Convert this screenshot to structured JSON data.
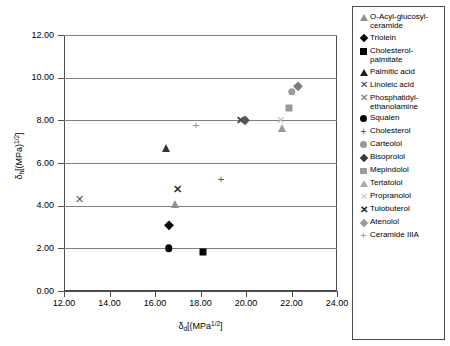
{
  "chart_data": {
    "type": "scatter",
    "title": "",
    "xlabel": "δd[(MPa)1/2]",
    "ylabel": "δh[(MPa)1/2]",
    "xlabel_parts": {
      "symbol": "δ",
      "sub": "d",
      "rest": "[(MPa",
      "sup": "1/2",
      "tail": "]"
    },
    "ylabel_parts": {
      "symbol": "δ",
      "sub": "h",
      "rest": "[(MPa)",
      "sup": "1/2",
      "tail": "]"
    },
    "xlim": [
      12.0,
      24.0
    ],
    "ylim": [
      0.0,
      12.0
    ],
    "xticks": [
      "12.00",
      "14.00",
      "16.00",
      "18.00",
      "20.00",
      "22.00",
      "24.00"
    ],
    "yticks": [
      "0.00",
      "2.00",
      "4.00",
      "6.00",
      "8.00",
      "10.00",
      "12.00"
    ],
    "xtick_values": [
      12,
      14,
      16,
      18,
      20,
      22,
      24
    ],
    "ytick_values": [
      0,
      2,
      4,
      6,
      8,
      10,
      12
    ],
    "grid": "horizontal",
    "legend_position": "right-outside",
    "points": [
      {
        "label": "O-Acyl-glucosyl-ceramide",
        "marker": "triangle",
        "color": "#909090",
        "x": 16.9,
        "y": 4.1
      },
      {
        "label": "Triolein",
        "marker": "diamond",
        "color": "#000000",
        "x": 16.6,
        "y": 3.1
      },
      {
        "label": "Cholesterol-palmitate",
        "marker": "square",
        "color": "#000000",
        "x": 18.1,
        "y": 1.85
      },
      {
        "label": "Palmitic acid",
        "marker": "triangle",
        "color": "#333333",
        "x": 16.5,
        "y": 6.7
      },
      {
        "label": "Linoleic acid",
        "marker": "x",
        "color": "#555555",
        "x": 12.7,
        "y": 4.3
      },
      {
        "label": "Phosphatidyl-ethanolamine",
        "marker": "x-bold",
        "color": "#333333",
        "x": 17.0,
        "y": 4.8
      },
      {
        "label": "Squalen",
        "marker": "circle",
        "color": "#000000",
        "x": 16.6,
        "y": 2.0
      },
      {
        "label": "Cholesterol",
        "marker": "plus",
        "color": "#555555",
        "x": 18.9,
        "y": 5.25
      },
      {
        "label": "Carteolol",
        "marker": "circle",
        "color": "#9a9a9a",
        "x": 22.0,
        "y": 9.35
      },
      {
        "label": "Bisoprolol",
        "marker": "diamond",
        "color": "#7a7a7a",
        "x": 22.3,
        "y": 9.62
      },
      {
        "label": "Mepindolol",
        "marker": "square",
        "color": "#9a9a9a",
        "x": 21.9,
        "y": 8.6
      },
      {
        "label": "Tertatolol",
        "marker": "triangle",
        "color": "#9a9a9a",
        "x": 21.6,
        "y": 7.65
      },
      {
        "label": "Propranolol",
        "marker": "x",
        "color": "#c0c0c0",
        "x": 21.5,
        "y": 8.0
      },
      {
        "label": "Tulobuterol",
        "marker": "x-bold",
        "color": "#333333",
        "x": 19.75,
        "y": 8.0
      },
      {
        "label": "Atenolol",
        "marker": "diamond",
        "color": "#555555",
        "x": 19.95,
        "y": 8.0
      },
      {
        "label": "Ceramide IIIA",
        "marker": "plus",
        "color": "#888888",
        "x": 17.8,
        "y": 7.8
      }
    ]
  },
  "legend": {
    "items": [
      {
        "label": "O-Acyl-glucosyl-\nceramide",
        "marker": "triangle",
        "color": "#909090"
      },
      {
        "label": "Triolein",
        "marker": "diamond",
        "color": "#000000"
      },
      {
        "label": "Cholesterol-\npalmitate",
        "marker": "square",
        "color": "#000000"
      },
      {
        "label": "Palmitic acid",
        "marker": "triangle",
        "color": "#222222"
      },
      {
        "label": "Linoleic acid",
        "marker": "x",
        "color": "#333333"
      },
      {
        "label": "Phosphatidyl-\nethanolamine",
        "marker": "x-bold",
        "color": "#8a8a8a"
      },
      {
        "label": "Squalen",
        "marker": "circle",
        "color": "#000000"
      },
      {
        "label": "Cholesterol",
        "marker": "plus",
        "color": "#555555"
      },
      {
        "label": "Carteolol",
        "marker": "circle",
        "color": "#9a9a9a"
      },
      {
        "label": "Bisoprolol",
        "marker": "diamond",
        "color": "#3a3a3a"
      },
      {
        "label": "Mepindolol",
        "marker": "square",
        "color": "#9a9a9a"
      },
      {
        "label": "Tertatolol",
        "marker": "triangle",
        "color": "#aaaaaa"
      },
      {
        "label": "Propranolol",
        "marker": "x",
        "color": "#c8c8c8"
      },
      {
        "label": "Tulobuterol",
        "marker": "x-bold",
        "color": "#1a1a1a"
      },
      {
        "label": "Atenolol",
        "marker": "diamond",
        "color": "#9a9a9a"
      },
      {
        "label": "Ceramide IIIA",
        "marker": "plus",
        "color": "#999999"
      }
    ]
  },
  "colors": {
    "axis": "#4d4d4d",
    "grid": "#808080",
    "background": "#ffffff"
  }
}
